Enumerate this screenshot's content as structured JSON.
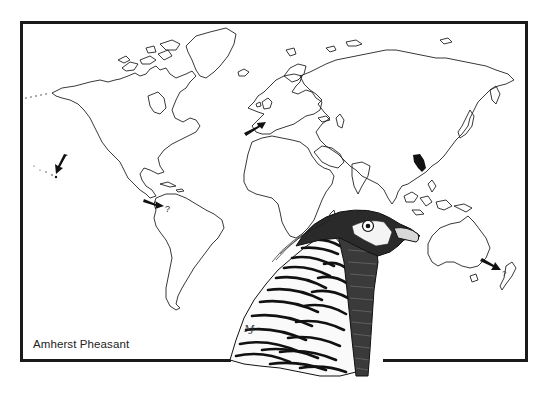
{
  "figure": {
    "caption": "Amherst Pheasant",
    "frame_color": "#1a1a1a",
    "ink_color": "#222222"
  },
  "map": {
    "type": "world-outline",
    "markers": [
      {
        "name": "hawaii",
        "kind": "arrow",
        "label": ""
      },
      {
        "name": "western-europe-britain",
        "kind": "arrow",
        "label": ""
      },
      {
        "name": "northwestern-south-america",
        "kind": "arrow",
        "label": "?"
      },
      {
        "name": "new-zealand",
        "kind": "arrow",
        "label": "?"
      },
      {
        "name": "native-range-china",
        "kind": "filled-region",
        "label": ""
      }
    ],
    "question_mark_sa": "?",
    "question_mark_nz": "?"
  },
  "artist_mark": "Ɱ"
}
